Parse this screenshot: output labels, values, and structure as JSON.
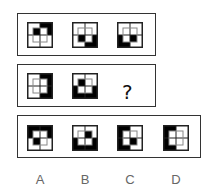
{
  "puzzle": {
    "row1": [
      {
        "id": "r1f1",
        "outer": {
          "tl": 0,
          "tr": 1,
          "bl": 0,
          "br": 0
        },
        "inner": {
          "tl": 1,
          "tr": 0,
          "bl": 0,
          "br": 0
        }
      },
      {
        "id": "r1f2",
        "outer": {
          "tl": 0,
          "tr": 0,
          "bl": 0,
          "br": 1
        },
        "inner": {
          "tl": 0,
          "tr": 0,
          "bl": 1,
          "br": 0
        }
      },
      {
        "id": "r1f3",
        "outer": {
          "tl": 0,
          "tr": 0,
          "bl": 1,
          "br": 0
        },
        "inner": {
          "tl": 0,
          "tr": 0,
          "bl": 0,
          "br": 1
        }
      }
    ],
    "row2": [
      {
        "id": "r2f1",
        "outer": {
          "tl": 0,
          "tr": 1,
          "bl": 0,
          "br": 1
        },
        "inner": {
          "tl": 0,
          "tr": 0,
          "bl": 0,
          "br": 0
        }
      },
      {
        "id": "r2f2",
        "outer": {
          "tl": 0,
          "tr": 0,
          "bl": 1,
          "br": 1
        },
        "inner": {
          "tl": 1,
          "tr": 0,
          "bl": 0,
          "br": 0
        }
      }
    ],
    "question_mark": "?",
    "options": [
      {
        "label": "A",
        "outer": {
          "tl": 1,
          "tr": 1,
          "bl": 0,
          "br": 0
        },
        "inner": {
          "tl": 0,
          "tr": 0,
          "bl": 1,
          "br": 0
        }
      },
      {
        "label": "B",
        "outer": {
          "tl": 0,
          "tr": 0,
          "bl": 1,
          "br": 1
        },
        "inner": {
          "tl": 0,
          "tr": 1,
          "bl": 0,
          "br": 0
        }
      },
      {
        "label": "C",
        "outer": {
          "tl": 1,
          "tr": 0,
          "bl": 1,
          "br": 0
        },
        "inner": {
          "tl": 0,
          "tr": 0,
          "bl": 0,
          "br": 1
        }
      },
      {
        "label": "D",
        "outer": {
          "tl": 1,
          "tr": 0,
          "bl": 1,
          "br": 0
        },
        "inner": {
          "tl": 0,
          "tr": 0,
          "bl": 0,
          "br": 0
        }
      }
    ],
    "colors": {
      "fill": "#000000",
      "line": "#222222",
      "background": "#ffffff"
    }
  }
}
